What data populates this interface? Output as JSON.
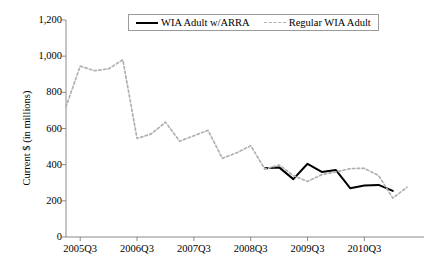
{
  "chart_data": {
    "type": "line",
    "title": "",
    "xlabel": "",
    "ylabel": "Current $ (in millions)",
    "ylim": [
      0,
      1200
    ],
    "ytick_labels": [
      "0",
      "200",
      "400",
      "600",
      "800",
      "1,000",
      "1,200"
    ],
    "ytick_values": [
      0,
      200,
      400,
      600,
      800,
      1000,
      1200
    ],
    "xtick_labels": [
      "2005Q3",
      "2006Q3",
      "2007Q3",
      "2008Q3",
      "2009Q3",
      "2010Q3"
    ],
    "xtick_quarters": [
      "2005Q3",
      "2006Q3",
      "2007Q3",
      "2008Q3",
      "2009Q3",
      "2010Q3"
    ],
    "grid": false,
    "legend_position": "top-center",
    "x": [
      "2005Q2",
      "2005Q3",
      "2005Q4",
      "2006Q1",
      "2006Q2",
      "2006Q3",
      "2006Q4",
      "2007Q1",
      "2007Q2",
      "2007Q3",
      "2007Q4",
      "2008Q1",
      "2008Q2",
      "2008Q3",
      "2008Q4",
      "2009Q1",
      "2009Q2",
      "2009Q3",
      "2009Q4",
      "2010Q1",
      "2010Q2",
      "2010Q3",
      "2010Q4",
      "2011Q1",
      "2011Q2"
    ],
    "series": [
      {
        "name": "WIA Adult w/ARRA",
        "style": "solid",
        "color": "#000000",
        "values": [
          null,
          null,
          null,
          null,
          null,
          null,
          null,
          null,
          null,
          null,
          null,
          null,
          null,
          null,
          380,
          385,
          320,
          405,
          360,
          370,
          270,
          285,
          288,
          255,
          null
        ]
      },
      {
        "name": "Regular WIA Adult",
        "style": "dashed",
        "color": "#b0b0b0",
        "values": [
          720,
          945,
          920,
          930,
          980,
          545,
          570,
          635,
          530,
          560,
          590,
          435,
          465,
          505,
          375,
          398,
          340,
          307,
          345,
          360,
          378,
          380,
          340,
          215,
          275
        ],
        "values_full": [
          720,
          945,
          920,
          930,
          980,
          545,
          570,
          635,
          530,
          560,
          590,
          435,
          465,
          505,
          375,
          398,
          340,
          307,
          345,
          360,
          378,
          380,
          340,
          215,
          275,
          268,
          272,
          260,
          222,
          232,
          225
        ]
      }
    ]
  },
  "legend": {
    "entries": [
      {
        "label": "WIA Adult w/ARRA",
        "style": "solid"
      },
      {
        "label": "Regular WIA Adult",
        "style": "dashed"
      }
    ]
  },
  "axes": {
    "y_title": "Current $ (in millions)"
  }
}
